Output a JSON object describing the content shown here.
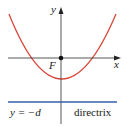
{
  "diagram": {
    "axes": {
      "x_label": "x",
      "y_label": "y"
    },
    "focus": {
      "label": "F"
    },
    "directrix": {
      "equation": "y = −d",
      "label": "directrix"
    },
    "colors": {
      "parabola": "#d9473a",
      "directrix": "#3a5ca8",
      "axes": "#333333",
      "focus_dot": "#111111"
    }
  }
}
